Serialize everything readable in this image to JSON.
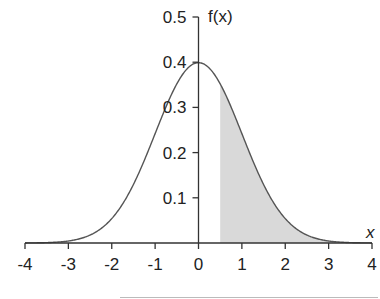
{
  "chart_data": {
    "type": "area",
    "title": "",
    "subtitle": "",
    "xlabel": "x",
    "ylabel": "f(x)",
    "xlim": [
      -4,
      4
    ],
    "ylim": [
      0,
      0.5
    ],
    "x_ticks": [
      -4,
      -3,
      -2,
      -1,
      0,
      1,
      2,
      3,
      4
    ],
    "x_tick_labels": [
      "-4",
      "-3",
      "-2",
      "-1",
      "0",
      "1",
      "2",
      "3",
      "4"
    ],
    "y_ticks": [
      0.1,
      0.2,
      0.3,
      0.4,
      0.5
    ],
    "y_tick_labels": [
      "0.1",
      "0.2",
      "0.3",
      "0.4",
      "0.5"
    ],
    "grid": false,
    "legend": null,
    "series": [
      {
        "name": "f(x)",
        "distribution": "standard normal N(0,1)",
        "x": [
          -4,
          -3.5,
          -3,
          -2.5,
          -2,
          -1.5,
          -1,
          -0.5,
          0,
          0.5,
          1,
          1.5,
          2,
          2.5,
          3,
          3.5,
          4
        ],
        "values": [
          0.0001,
          0.0009,
          0.0044,
          0.0175,
          0.054,
          0.1295,
          0.242,
          0.3521,
          0.3989,
          0.3521,
          0.242,
          0.1295,
          0.054,
          0.0175,
          0.0044,
          0.0009,
          0.0001
        ]
      }
    ],
    "shaded_region": {
      "from": 0.5,
      "to": 4,
      "color": "#d9d9d9"
    },
    "colors": {
      "curve": "#555555",
      "axes": "#333333",
      "shade": "#d9d9d9"
    }
  },
  "labels": {
    "y_axis": "f(x)",
    "x_axis": "x"
  }
}
